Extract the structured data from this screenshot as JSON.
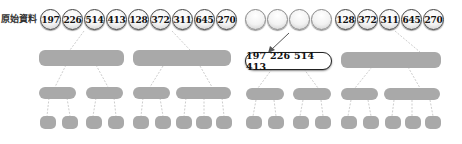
{
  "left_panel": {
    "label": "原始資料",
    "values": [
      "197",
      "226",
      "514",
      "413",
      "128",
      "372",
      "311",
      "645",
      "270"
    ]
  },
  "right_panel": {
    "empty_slots": 4,
    "values": [
      "128",
      "372",
      "311",
      "645",
      "270"
    ],
    "merged_box": "197 226 514 413"
  },
  "colors": {
    "node_fill": "#a9a9a9",
    "circle_border": "#444444",
    "arrow": "#555555"
  }
}
